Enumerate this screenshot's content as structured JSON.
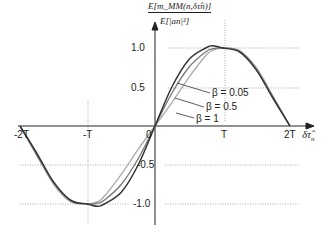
{
  "chart_data": {
    "type": "line",
    "title": "",
    "ylabel": "E[m_MM(n, δτ̂_n)] / E[|a_n|^2]",
    "ylabel_numerator": "E[m_MM(n,δτ̂n)]",
    "ylabel_denominator": "E[|an|²]",
    "xlabel": "δτ̂n",
    "x_ticks": [
      "-2T",
      "-T",
      "0",
      "T",
      "2T"
    ],
    "y_ticks": [
      "1.0",
      "0.5",
      "-0.5",
      "-1.0"
    ],
    "xlim": [
      "-2T",
      "2T"
    ],
    "ylim": [
      -1.05,
      1.05
    ],
    "grid": "dotted at ±0.5, ±1.0, x=±T",
    "legend_position": "inline annotations",
    "series": [
      {
        "name": "β = 0.05",
        "color": "#333333",
        "description": "peak ≈1.02 near x≈0.85T, passes (T,1.0)"
      },
      {
        "name": "β = 0.5",
        "color": "#777777",
        "description": "peak ≈1.0 near T"
      },
      {
        "name": "β = 1",
        "color": "#aaaaaa",
        "description": "peak 1.0 at T"
      }
    ],
    "x": [
      -2,
      -1.75,
      -1.5,
      -1.25,
      -1,
      -0.85,
      -0.75,
      -0.5,
      -0.25,
      0,
      0.25,
      0.5,
      0.75,
      0.85,
      1,
      1.25,
      1.5,
      1.75,
      2
    ],
    "values_beta_0_05": [
      0,
      -0.35,
      -0.72,
      -0.95,
      -1.0,
      -1.03,
      -1.0,
      -0.85,
      -0.5,
      0,
      0.5,
      0.85,
      1.0,
      1.03,
      1.0,
      0.95,
      0.72,
      0.35,
      0
    ],
    "values_beta_0_5": [
      0,
      -0.37,
      -0.73,
      -0.96,
      -1.0,
      -0.99,
      -0.95,
      -0.75,
      -0.42,
      0,
      0.42,
      0.75,
      0.95,
      0.99,
      1.0,
      0.96,
      0.73,
      0.37,
      0
    ],
    "values_beta_1": [
      0,
      -0.38,
      -0.75,
      -0.97,
      -1.0,
      -0.97,
      -0.9,
      -0.62,
      -0.3,
      0,
      0.3,
      0.62,
      0.9,
      0.97,
      1.0,
      0.97,
      0.75,
      0.38,
      0
    ]
  },
  "labels": {
    "tick_neg2T": "-2T",
    "tick_negT": "-T",
    "tick_0": "0",
    "tick_T": "T",
    "tick_2T": "2T",
    "ytick_1": "1.0",
    "ytick_05": "0.5",
    "ytick_neg05": "-0.5",
    "ytick_neg1": "-1.0",
    "xaxis": "δτ̂",
    "xaxis_sub": "n",
    "legend_b005": "β = 0.05",
    "legend_b05": "β = 0.5",
    "legend_b1": "β = 1"
  }
}
